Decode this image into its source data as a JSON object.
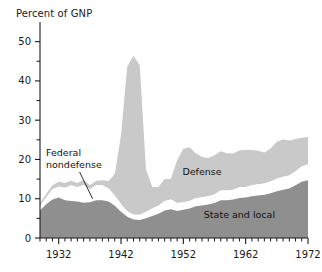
{
  "chart_data": {
    "type": "area",
    "stacked": true,
    "title": "",
    "ylabel": "Percent of GNP",
    "xlabel": "",
    "ylim": [
      0,
      55
    ],
    "xlim": [
      1929,
      1972
    ],
    "grid": false,
    "legend_position": "inline-annotations",
    "y_major_ticks": [
      0,
      10,
      20,
      30,
      40,
      50
    ],
    "y_minor_ticks": [
      5,
      15,
      25,
      35,
      45
    ],
    "y_tick_labels": [
      "0",
      "10",
      "20",
      "30",
      "40",
      "50"
    ],
    "x_major_ticks": [
      1932,
      1942,
      1952,
      1962,
      1972
    ],
    "x_tick_labels": [
      "1932",
      "1942",
      "1952",
      "1962",
      "1972"
    ],
    "x_minor_tick_interval": 1,
    "x": [
      1929,
      1930,
      1931,
      1932,
      1933,
      1934,
      1935,
      1936,
      1937,
      1938,
      1939,
      1940,
      1941,
      1942,
      1943,
      1944,
      1945,
      1946,
      1947,
      1948,
      1949,
      1950,
      1951,
      1952,
      1953,
      1954,
      1955,
      1956,
      1957,
      1958,
      1959,
      1960,
      1961,
      1962,
      1963,
      1964,
      1965,
      1966,
      1967,
      1968,
      1969,
      1970,
      1971,
      1972
    ],
    "series": [
      {
        "name": "State and local",
        "color": "#8f8f8f",
        "values": [
          7.0,
          8.6,
          9.8,
          10.3,
          9.6,
          9.4,
          9.3,
          9.0,
          9.1,
          9.6,
          9.6,
          9.3,
          8.2,
          6.7,
          5.4,
          4.7,
          4.6,
          5.0,
          5.6,
          6.2,
          7.0,
          7.3,
          6.9,
          7.2,
          7.5,
          8.1,
          8.3,
          8.5,
          8.9,
          9.6,
          9.6,
          9.8,
          10.2,
          10.3,
          10.6,
          10.8,
          11.0,
          11.4,
          11.9,
          12.3,
          12.6,
          13.4,
          14.3,
          14.7
        ]
      },
      {
        "name": "Federal nondefense",
        "color": "#ffffff",
        "values": [
          1.2,
          1.8,
          2.6,
          2.8,
          3.2,
          4.0,
          3.6,
          4.5,
          3.3,
          3.8,
          3.8,
          3.3,
          2.6,
          1.9,
          1.4,
          1.2,
          1.3,
          1.6,
          1.9,
          2.0,
          2.4,
          2.5,
          2.0,
          1.9,
          1.9,
          2.0,
          2.1,
          2.1,
          2.2,
          2.5,
          2.5,
          2.5,
          2.7,
          2.7,
          2.8,
          2.9,
          2.9,
          3.0,
          3.2,
          3.3,
          3.3,
          3.6,
          3.9,
          4.0
        ]
      },
      {
        "name": "Defense",
        "color": "#c9c9c9",
        "values": [
          0.7,
          0.8,
          1.0,
          1.2,
          1.2,
          1.2,
          1.1,
          1.2,
          1.1,
          1.2,
          1.3,
          1.9,
          5.5,
          17.6,
          36.9,
          40.5,
          38.1,
          11.0,
          5.5,
          4.8,
          5.6,
          5.2,
          10.9,
          13.6,
          13.7,
          11.5,
          10.2,
          9.8,
          10.0,
          10.0,
          9.5,
          9.2,
          9.4,
          9.5,
          9.0,
          8.5,
          7.9,
          8.4,
          9.4,
          9.5,
          8.9,
          8.2,
          7.3,
          7.0
        ]
      }
    ],
    "totals_note": "Total government purchases/expenditures as percent of GNP",
    "peak": {
      "year": 1944,
      "value": 46.4
    },
    "annotations": [
      {
        "name": "federal-nondefense",
        "text_line1": "Federal",
        "text_line2": "nondefense",
        "points_to_year": 1936,
        "points_to_value": 12.0
      },
      {
        "name": "defense",
        "text": "Defense",
        "at_year": 1955,
        "at_value": 16.0
      },
      {
        "name": "state-and-local",
        "text": "State and local",
        "at_year": 1961,
        "at_value": 5.0
      }
    ]
  },
  "labels": {
    "y_axis_title": "Percent of GNP",
    "defense": "Defense",
    "state_and_local": "State and local",
    "federal_line1": "Federal",
    "federal_line2": "nondefense",
    "y_0": "0",
    "y_10": "10",
    "y_20": "20",
    "y_30": "30",
    "y_40": "40",
    "y_50": "50",
    "x_1932": "1932",
    "x_1942": "1942",
    "x_1952": "1952",
    "x_1962": "1962",
    "x_1972": "1972"
  },
  "colors": {
    "state_local": "#8f8f8f",
    "federal_nondefense": "#ffffff",
    "defense": "#c9c9c9",
    "axis": "#1a1a1a",
    "text": "#111111",
    "background": "#ffffff"
  }
}
